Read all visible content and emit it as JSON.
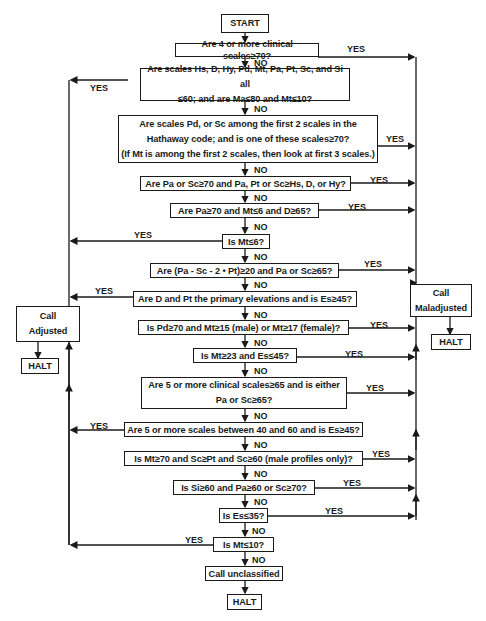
{
  "flowchart": {
    "start": "START",
    "decisions": [
      {
        "id": "q1",
        "text": [
          "Are 4 or more clinical scales≥70?"
        ],
        "yes_to": "maladjusted"
      },
      {
        "id": "q2",
        "text": [
          "Are scales Hs, D, Hy, Pd, Mt, Pa, Pt, Sc, and Si all",
          "≤60; and are Ma≤80 and Mt≤10?"
        ],
        "yes_to": "adjusted"
      },
      {
        "id": "q3",
        "text": [
          "Are scales Pd, or Sc among the first 2 scales in the",
          "Hathaway code; and is one of these scales≥70?",
          "(If Mt is among the first 2 scales, then look at first 3 scales.)"
        ],
        "yes_to": "maladjusted"
      },
      {
        "id": "q4",
        "text": [
          "Are Pa or Sc≥70 and Pa, Pt or Sc≥Hs, D, or Hy?"
        ],
        "yes_to": "maladjusted"
      },
      {
        "id": "q5",
        "text": [
          "Are Pa≥70 and Mt≤6 and D≥65?"
        ],
        "yes_to": "maladjusted"
      },
      {
        "id": "q6",
        "text": [
          "Is Mt≤6?"
        ],
        "yes_to": "adjusted"
      },
      {
        "id": "q7",
        "text": [
          "Are (Pa - Sc - 2 • Pt)≥20 and Pa or Sc≥65?"
        ],
        "yes_to": "maladjusted"
      },
      {
        "id": "q8",
        "text": [
          "Are D and Pt the primary elevations and is Es≥45?"
        ],
        "yes_to": "adjusted"
      },
      {
        "id": "q9",
        "text": [
          "Is Pd≥70 and Mt≥15 (male) or Mt≥17 (female)?"
        ],
        "yes_to": "maladjusted"
      },
      {
        "id": "q10",
        "text": [
          "Is Mt≥23 and Es≤45?"
        ],
        "yes_to": "maladjusted"
      },
      {
        "id": "q11",
        "text": [
          "Are 5 or more clinical scales≥65 and is either",
          "Pa or Sc≥65?"
        ],
        "yes_to": "maladjusted"
      },
      {
        "id": "q12",
        "text": [
          "Are 5 or more scales between 40 and 60 and is Es≥45?"
        ],
        "yes_to": "adjusted"
      },
      {
        "id": "q13",
        "text": [
          "Is Mt≥70 and Sc≥Pt and Sc≥60 (male profiles only)?"
        ],
        "yes_to": "maladjusted"
      },
      {
        "id": "q14",
        "text": [
          "Is Si≥60 and Pa≥60 or Sc≥70?"
        ],
        "yes_to": "maladjusted"
      },
      {
        "id": "q15",
        "text": [
          "Is Es≤35?"
        ],
        "yes_to": "maladjusted"
      },
      {
        "id": "q16",
        "text": [
          "Is Mt≤10?"
        ],
        "yes_to": "adjusted"
      }
    ],
    "outcomes": {
      "adjusted": [
        "Call",
        "Adjusted"
      ],
      "maladjusted": [
        "Call",
        "Maladjusted"
      ],
      "unclassified": "Call unclassified",
      "halt": "HALT"
    },
    "labels": {
      "yes": "YES",
      "no": "NO"
    }
  }
}
